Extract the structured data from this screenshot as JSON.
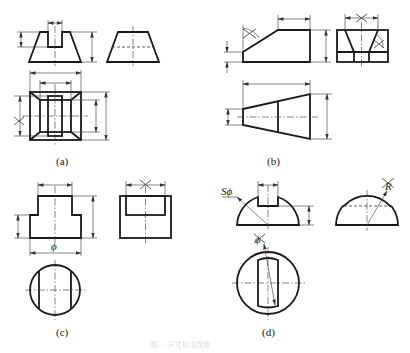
{
  "figure": {
    "subfigures": [
      {
        "id": "a",
        "caption": "(a)",
        "description": "Frustum block with slot: front view, side view, top view with dimension lines; one dimension marked wrong (X)"
      },
      {
        "id": "b",
        "caption": "(b)",
        "description": "Inclined-cut block: front view, side view with tapered slot, top view; two dimensions marked wrong (X)"
      },
      {
        "id": "c",
        "caption": "(c)",
        "description": "Stepped cylinder with flats: front view with diameter symbol, side view, top circular view; one dimension marked wrong (X)"
      },
      {
        "id": "d",
        "caption": "(d)",
        "description": "Slotted hemisphere: front view with S-phi sphere diameter, side view with radius R, top view with phi; two dimensions marked wrong (X)"
      }
    ],
    "symbols": {
      "diameter": "ϕ",
      "sphere_diameter": "Sϕ",
      "radius": "R",
      "wrong_mark": "×"
    },
    "footer_caption": "图 — 尺寸标注改错"
  }
}
